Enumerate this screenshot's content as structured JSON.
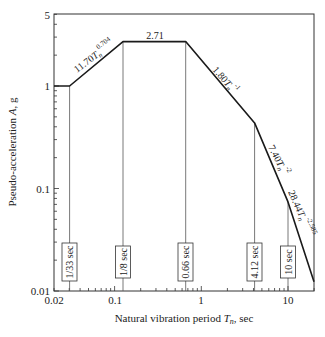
{
  "chart_data": {
    "type": "line",
    "title": "",
    "xlabel": "Natural vibration period T_n, sec",
    "xlabel_parts": {
      "pre": "Natural vibration period ",
      "var": "T",
      "sub": "n",
      "post": ", sec"
    },
    "ylabel": "Pseudo-acceleration A, g",
    "ylabel_parts": {
      "pre": "Pseudo-acceleration ",
      "var": "A",
      "post": ", g"
    },
    "xscale": "log",
    "yscale": "log",
    "xlim": [
      0.02,
      20
    ],
    "ylim": [
      0.01,
      5
    ],
    "grid": false,
    "x_ticks": [
      {
        "value": 0.02,
        "label": "0.02"
      },
      {
        "value": 0.1,
        "label": "0.1"
      },
      {
        "value": 1,
        "label": "1"
      },
      {
        "value": 10,
        "label": "10"
      }
    ],
    "y_ticks": [
      {
        "value": 0.01,
        "label": "0.01"
      },
      {
        "value": 0.1,
        "label": "0.1"
      },
      {
        "value": 1,
        "label": "1"
      },
      {
        "value": 5,
        "label": "5"
      }
    ],
    "series": [
      {
        "name": "Design spectrum",
        "x": [
          0.02,
          0.0303,
          0.125,
          0.66,
          4.12,
          10,
          20
        ],
        "y": [
          1.0,
          1.0,
          2.71,
          2.71,
          0.437,
          0.074,
          0.0123
        ]
      }
    ],
    "segment_labels": [
      {
        "text": "11.70T_n^0.704",
        "main": "11.70",
        "var": "T",
        "sub": "n",
        "exp": "0.704"
      },
      {
        "text": "2.71",
        "main": "2.71"
      },
      {
        "text": "1.80T_n^-1",
        "main": "1.80",
        "var": "T",
        "sub": "n",
        "exp": "-1"
      },
      {
        "text": "7.40T_n^-2",
        "main": "7.40",
        "var": "T",
        "sub": "n",
        "exp": "-2"
      },
      {
        "text": "28.44T_n^-2.585",
        "main": "28.44",
        "var": "T",
        "sub": "n",
        "exp": "-2.585"
      }
    ],
    "period_markers": [
      {
        "value": 0.0303,
        "label": "1/33 sec"
      },
      {
        "value": 0.125,
        "label": "1/8 sec"
      },
      {
        "value": 0.66,
        "label": "0.66 sec"
      },
      {
        "value": 4.12,
        "label": "4.12 sec"
      },
      {
        "value": 10,
        "label": "10 sec"
      }
    ]
  }
}
